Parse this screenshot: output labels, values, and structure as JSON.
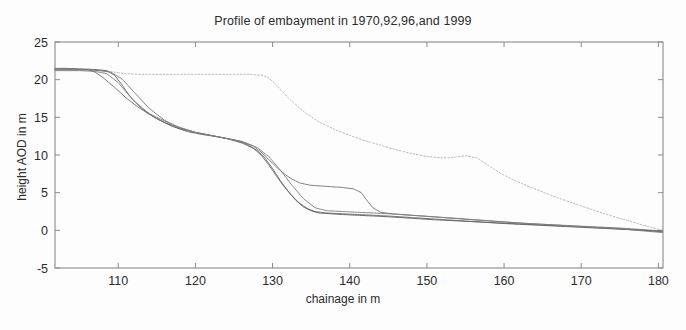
{
  "chart_data": {
    "type": "line",
    "title": "Profile of embayment in 1970,92,96,and 1999",
    "xlabel": "chainage in m",
    "ylabel": "height AOD in m",
    "xlim": [
      101.8,
      180.6
    ],
    "ylim": [
      -5,
      25
    ],
    "xticks": [
      110,
      120,
      130,
      140,
      150,
      160,
      170,
      180
    ],
    "yticks": [
      -5,
      0,
      5,
      10,
      15,
      20,
      25
    ],
    "xtick_labels": [
      "110",
      "120",
      "130",
      "140",
      "150",
      "160",
      "170",
      "180"
    ],
    "ytick_labels": [
      "-5",
      "0",
      "5",
      "10",
      "15",
      "20",
      "25"
    ],
    "grid": false,
    "legend": "none",
    "line_color": "#6e6e6e",
    "axis_color": "#8a8a8a",
    "series": [
      {
        "name": "1970",
        "style": "dotted",
        "color": "#b9b9b9",
        "x": [
          101.8,
          104.0,
          106.5,
          108.0,
          109.5,
          111.0,
          113.0,
          116.0,
          120.0,
          124.0,
          127.0,
          128.6,
          129.4,
          130.5,
          132.0,
          134.0,
          136.0,
          138.0,
          140.0,
          142.0,
          144.0,
          146.0,
          148.0,
          150.0,
          152.0,
          153.5,
          155.0,
          156.5,
          158.0,
          159.5,
          161.0,
          163.0,
          165.0,
          167.0,
          169.0,
          171.0,
          173.0,
          175.0,
          177.0,
          179.0,
          180.5
        ],
        "y": [
          21.4,
          21.4,
          21.3,
          21.2,
          21.0,
          20.8,
          20.7,
          20.7,
          20.7,
          20.7,
          20.7,
          20.6,
          20.3,
          19.3,
          17.6,
          15.8,
          14.4,
          13.4,
          12.6,
          11.9,
          11.3,
          10.7,
          10.2,
          9.8,
          9.6,
          9.7,
          9.9,
          9.6,
          8.6,
          7.6,
          6.8,
          5.9,
          5.1,
          4.3,
          3.6,
          2.9,
          2.2,
          1.6,
          1.0,
          0.4,
          0.0
        ]
      },
      {
        "name": "1992",
        "style": "solid",
        "color": "#6b6b6b",
        "x": [
          101.8,
          103.5,
          105.0,
          106.2,
          107.0,
          108.0,
          109.5,
          111.0,
          112.5,
          114.0,
          116.0,
          118.0,
          120.0,
          122.0,
          124.0,
          126.0,
          127.5,
          128.5,
          129.5,
          130.5,
          131.5,
          132.5,
          133.5,
          134.5,
          135.5,
          137.0,
          139.0,
          141.0,
          143.0,
          145.0,
          148.0,
          151.0,
          154.0,
          157.0,
          160.0,
          164.0,
          168.0,
          172.0,
          176.0,
          180.5
        ],
        "y": [
          21.5,
          21.5,
          21.4,
          21.3,
          21.0,
          20.3,
          19.0,
          17.6,
          16.4,
          15.4,
          14.3,
          13.5,
          13.0,
          12.6,
          12.2,
          11.6,
          10.9,
          10.0,
          8.7,
          7.2,
          5.8,
          4.6,
          3.6,
          2.9,
          2.5,
          2.3,
          2.2,
          2.1,
          2.0,
          1.9,
          1.7,
          1.5,
          1.3,
          1.1,
          0.9,
          0.7,
          0.5,
          0.3,
          0.1,
          -0.1
        ]
      },
      {
        "name": "1996",
        "style": "solid",
        "color": "#5f5f5f",
        "x": [
          101.8,
          104.0,
          106.0,
          107.5,
          108.5,
          109.5,
          110.5,
          111.5,
          113.0,
          115.0,
          117.0,
          119.0,
          121.0,
          123.0,
          125.0,
          126.5,
          128.0,
          129.0,
          130.0,
          131.0,
          132.0,
          133.0,
          134.0,
          135.0,
          136.0,
          137.5,
          139.0,
          141.0,
          143.0,
          145.0,
          148.0,
          151.0,
          155.0,
          159.0,
          163.0,
          167.0,
          171.0,
          175.0,
          178.0,
          180.5
        ],
        "y": [
          21.4,
          21.4,
          21.4,
          21.3,
          21.2,
          20.6,
          19.3,
          17.8,
          16.2,
          14.8,
          13.8,
          13.1,
          12.7,
          12.4,
          12.0,
          11.5,
          10.6,
          9.6,
          8.2,
          6.6,
          5.2,
          4.0,
          3.1,
          2.6,
          2.3,
          2.2,
          2.1,
          2.0,
          1.9,
          1.8,
          1.6,
          1.4,
          1.2,
          1.0,
          0.8,
          0.6,
          0.4,
          0.2,
          0.0,
          -0.2
        ]
      },
      {
        "name": "1999",
        "style": "solid",
        "color": "#737373",
        "x": [
          101.8,
          104.0,
          106.0,
          107.5,
          109.0,
          110.5,
          112.0,
          114.0,
          116.0,
          118.0,
          120.0,
          122.0,
          124.0,
          126.0,
          127.5,
          128.5,
          129.5,
          130.5,
          131.5,
          132.5,
          133.5,
          134.8,
          136.0,
          137.5,
          139.0,
          140.5,
          141.5,
          142.2,
          143.0,
          144.0,
          145.5,
          148.0,
          151.0,
          155.0,
          159.0,
          163.0,
          167.0,
          171.0,
          175.0,
          178.0,
          180.5
        ],
        "y": [
          21.3,
          21.3,
          21.3,
          21.2,
          21.0,
          20.1,
          18.4,
          16.2,
          14.6,
          13.6,
          13.0,
          12.6,
          12.2,
          11.8,
          11.2,
          10.4,
          9.4,
          8.4,
          7.5,
          6.8,
          6.3,
          6.0,
          5.9,
          5.8,
          5.7,
          5.5,
          5.0,
          4.0,
          3.0,
          2.4,
          2.2,
          2.0,
          1.8,
          1.5,
          1.2,
          0.9,
          0.7,
          0.5,
          0.3,
          0.1,
          -0.1
        ]
      },
      {
        "name": "1999b",
        "style": "solid",
        "color": "#7d7d7d",
        "x": [
          101.8,
          105.0,
          107.0,
          108.5,
          110.0,
          112.0,
          114.0,
          117.0,
          120.0,
          123.0,
          126.0,
          128.0,
          129.5,
          131.0,
          132.5,
          134.0,
          135.5,
          137.0,
          139.0,
          141.0,
          143.0,
          145.0,
          148.0,
          152.0,
          156.0,
          160.0,
          165.0,
          170.0,
          175.0,
          180.5
        ],
        "y": [
          21.2,
          21.2,
          21.1,
          20.8,
          19.6,
          17.2,
          15.5,
          14.0,
          13.0,
          12.4,
          11.8,
          11.0,
          9.8,
          8.0,
          6.0,
          4.2,
          3.0,
          2.6,
          2.5,
          2.4,
          2.3,
          2.2,
          2.0,
          1.7,
          1.4,
          1.1,
          0.8,
          0.5,
          0.2,
          -0.3
        ]
      }
    ]
  },
  "plot_box": {
    "left": 55,
    "top": 42,
    "right": 663,
    "bottom": 268
  }
}
